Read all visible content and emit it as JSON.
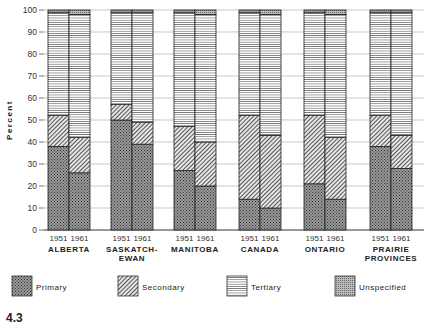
{
  "chart_data": {
    "type": "bar",
    "stacked": true,
    "title": "",
    "xlabel": "",
    "ylabel": "Percent",
    "ylim": [
      0,
      100
    ],
    "yticks": [
      0,
      10,
      20,
      30,
      40,
      50,
      60,
      70,
      80,
      90,
      100
    ],
    "grid": true,
    "figure_label": "4.3",
    "groups": [
      {
        "name": "ALBERTA",
        "lines": [
          "ALBERTA"
        ]
      },
      {
        "name": "SASKATCHEWAN",
        "lines": [
          "SASKATCH-",
          "EWAN"
        ]
      },
      {
        "name": "MANITOBA",
        "lines": [
          "MANITOBA"
        ]
      },
      {
        "name": "CANADA",
        "lines": [
          "CANADA"
        ]
      },
      {
        "name": "ONTARIO",
        "lines": [
          "ONTARIO"
        ]
      },
      {
        "name": "PRAIRIE PROVINCES",
        "lines": [
          "PRAIRIE",
          "PROVINCES"
        ]
      }
    ],
    "years": [
      "1951",
      "1961"
    ],
    "categories": [
      "Alberta 1951",
      "Alberta 1961",
      "Saskatchewan 1951",
      "Saskatchewan 1961",
      "Manitoba 1951",
      "Manitoba 1961",
      "Canada 1951",
      "Canada 1961",
      "Ontario 1951",
      "Ontario 1961",
      "Prairie Provinces 1951",
      "Prairie Provinces 1961"
    ],
    "series": [
      {
        "name": "Primary",
        "pattern": "crosshatch",
        "values": [
          38,
          26,
          50,
          39,
          27,
          20,
          14,
          10,
          21,
          14,
          38,
          28
        ]
      },
      {
        "name": "Secondary",
        "pattern": "diagonal",
        "values": [
          14,
          16,
          7,
          10,
          20,
          20,
          38,
          33,
          31,
          28,
          14,
          15
        ]
      },
      {
        "name": "Tertiary",
        "pattern": "horizontal",
        "values": [
          47,
          56,
          42,
          50,
          52,
          58,
          47,
          55,
          47,
          56,
          47,
          56
        ]
      },
      {
        "name": "Unspecified",
        "pattern": "dense-dots",
        "values": [
          1,
          2,
          1,
          1,
          1,
          2,
          1,
          2,
          1,
          2,
          1,
          1
        ]
      }
    ],
    "legend_position": "bottom"
  },
  "legend": {
    "items": [
      "Primary",
      "Secondary",
      "Tertiary",
      "Unspecified"
    ]
  }
}
